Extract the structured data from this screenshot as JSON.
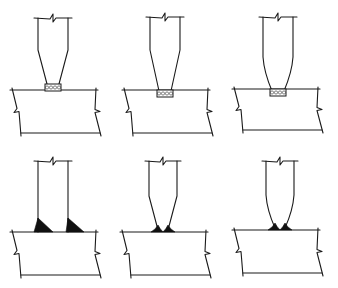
{
  "diagram": {
    "title": "",
    "background": "#ffffff",
    "line_color": "#1a1a1a",
    "weld_fill_color": "#111111",
    "rows": [
      {
        "row": "top",
        "description": "Stiffener/web with tapered end on plate, weld deposit at base (cross-hatched)",
        "panels": [
          {
            "id": "a1",
            "cx": 53,
            "stemTop": 18,
            "stemHalf": 15,
            "taperStart": 50,
            "neckHalf": 6,
            "neckY": 84,
            "weld": "hatched",
            "plateTop": 90,
            "plateBottom": 133,
            "plateLeft": 12,
            "plateRight": 96
          },
          {
            "id": "a2",
            "cx": 165,
            "stemTop": 17,
            "stemHalf": 15,
            "taperStart": 50,
            "neckHalf": 6,
            "neckY": 91,
            "weld": "hatched-inset",
            "plateTop": 90,
            "plateBottom": 133,
            "plateLeft": 124,
            "plateRight": 208
          },
          {
            "id": "a3",
            "cx": 278,
            "stemTop": 17,
            "stemHalf": 15,
            "taperStart": 57,
            "neckHalf": 6,
            "neckY": 91,
            "weld": "hatched-inset-curved",
            "plateTop": 89,
            "plateBottom": 130,
            "plateLeft": 234,
            "plateRight": 318
          }
        ]
      },
      {
        "row": "bottom",
        "description": "Web attached to plate with fillet welds (solid black)",
        "panels": [
          {
            "id": "b1",
            "cx": 53,
            "stemTop": 161,
            "stemHalf": 15,
            "taperStart": null,
            "neckHalf": 15,
            "neckY": 232,
            "weld": "fillet-large",
            "plateTop": 232,
            "plateBottom": 275,
            "plateLeft": 12,
            "plateRight": 96
          },
          {
            "id": "b2",
            "cx": 163,
            "stemTop": 161,
            "stemHalf": 14,
            "taperStart": 196,
            "neckHalf": 5,
            "neckY": 230,
            "weld": "fillet-small",
            "plateTop": 232,
            "plateBottom": 275,
            "plateLeft": 122,
            "plateRight": 206
          },
          {
            "id": "b3",
            "cx": 280,
            "stemTop": 161,
            "stemHalf": 14,
            "taperStart": 195,
            "neckHalf": 5,
            "neckY": 228,
            "weld": "fillet-small-curved",
            "plateTop": 230,
            "plateBottom": 273,
            "plateLeft": 234,
            "plateRight": 318
          }
        ]
      }
    ],
    "labels": []
  }
}
